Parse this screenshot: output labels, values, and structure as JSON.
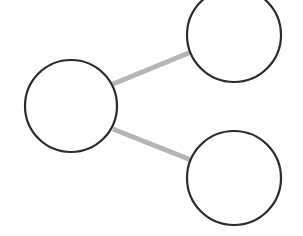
{
  "diagram": {
    "type": "graph",
    "background": "#ffffff",
    "node_stroke": "#2b2b2b",
    "node_stroke_width": 2.2,
    "node_fill": "#ffffff",
    "edge_color": "#b5b5b5",
    "edge_width": 5,
    "nodes": [
      {
        "id": "left",
        "cx": 71,
        "cy": 106,
        "r": 46
      },
      {
        "id": "top-right",
        "cx": 234,
        "cy": 35,
        "r": 47
      },
      {
        "id": "bottom-right",
        "cx": 234,
        "cy": 178,
        "r": 47
      }
    ],
    "edges": [
      {
        "from": "left",
        "to": "top-right",
        "x1": 113,
        "y1": 84,
        "x2": 191,
        "y2": 52
      },
      {
        "from": "left",
        "to": "bottom-right",
        "x1": 113,
        "y1": 129,
        "x2": 191,
        "y2": 160
      }
    ]
  }
}
